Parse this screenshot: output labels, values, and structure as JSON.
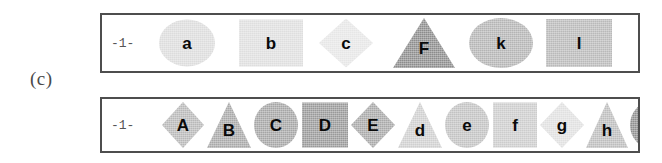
{
  "figure": {
    "caption": "(c)",
    "colors": {
      "border": "#4e4e4e",
      "background": "#ffffff",
      "letter": "#0a0a0a",
      "index_label": "#555555"
    }
  },
  "rows": [
    {
      "name": "row-1",
      "index_label": "-1-",
      "shapes": [
        {
          "letter": "a",
          "shape": "ellipse",
          "fill": "#dcdcdc",
          "x": 57,
          "w": 56,
          "h": 47
        },
        {
          "letter": "b",
          "shape": "rect",
          "fill": "#dedede",
          "x": 137,
          "w": 64,
          "h": 47
        },
        {
          "letter": "c",
          "shape": "diamond",
          "fill": "#e6e6e6",
          "x": 217,
          "w": 54,
          "h": 49
        },
        {
          "letter": "F",
          "shape": "triangle",
          "fill": "#8c8c8c",
          "x": 291,
          "w": 62,
          "h": 50
        },
        {
          "letter": "k",
          "shape": "ellipse",
          "fill": "#b4b4b4",
          "x": 367,
          "w": 64,
          "h": 50
        },
        {
          "letter": "l",
          "shape": "rect",
          "fill": "#b9b9b9",
          "x": 444,
          "w": 66,
          "h": 48
        }
      ]
    },
    {
      "name": "row-2",
      "index_label": "-1-",
      "shapes": [
        {
          "letter": "A",
          "shape": "diamond",
          "fill": "#b8b8b8",
          "x": 60,
          "w": 42,
          "h": 46
        },
        {
          "letter": "B",
          "shape": "triangle",
          "fill": "#a8a8a8",
          "x": 105,
          "w": 44,
          "h": 46
        },
        {
          "letter": "C",
          "shape": "ellipse",
          "fill": "#a5a5a5",
          "x": 152,
          "w": 44,
          "h": 46
        },
        {
          "letter": "D",
          "shape": "rect",
          "fill": "#999999",
          "x": 200,
          "w": 46,
          "h": 45
        },
        {
          "letter": "E",
          "shape": "diamond",
          "fill": "#a8a8a8",
          "x": 249,
          "w": 44,
          "h": 46
        },
        {
          "letter": "d",
          "shape": "triangle",
          "fill": "#cfcfcf",
          "x": 296,
          "w": 44,
          "h": 46
        },
        {
          "letter": "e",
          "shape": "ellipse",
          "fill": "#c2c2c2",
          "x": 343,
          "w": 44,
          "h": 46
        },
        {
          "letter": "f",
          "shape": "rect",
          "fill": "#cccccc",
          "x": 391,
          "w": 44,
          "h": 45
        },
        {
          "letter": "g",
          "shape": "diamond",
          "fill": "#e0e0e0",
          "x": 438,
          "w": 44,
          "h": 46
        },
        {
          "letter": "h",
          "shape": "triangle",
          "fill": "#bdbdbd",
          "x": 484,
          "w": 42,
          "h": 46
        },
        {
          "letter": "G",
          "shape": "ellipse",
          "fill": "#8f8f8f",
          "x": 528,
          "w": 46,
          "h": 48
        },
        {
          "letter": "H",
          "shape": "rect",
          "fill": "#8c8c8c",
          "x": 578,
          "w": 46,
          "h": 46
        }
      ]
    }
  ]
}
